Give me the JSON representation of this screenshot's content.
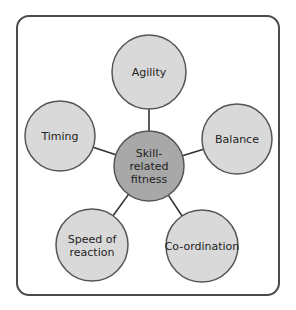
{
  "diagram": {
    "type": "spider",
    "colors": {
      "frame": "#4a4a4a",
      "outer_fill": "#d9d9d9",
      "center_fill": "#a8a8a8",
      "stroke": "#555555",
      "line": "#333333"
    },
    "center": {
      "lines": [
        "Skill-",
        "related",
        "fitness"
      ],
      "cx": 149,
      "cy": 166,
      "r": 35
    },
    "nodes": [
      {
        "id": "agility",
        "lines": [
          "Agility"
        ],
        "cx": 149,
        "cy": 72,
        "r": 37
      },
      {
        "id": "balance",
        "lines": [
          "Balance"
        ],
        "cx": 237,
        "cy": 139,
        "r": 35
      },
      {
        "id": "coordination",
        "lines": [
          "Co-ordination"
        ],
        "cx": 202,
        "cy": 246,
        "r": 36
      },
      {
        "id": "speed-of-reaction",
        "lines": [
          "Speed of",
          "reaction"
        ],
        "cx": 92,
        "cy": 245,
        "r": 36
      },
      {
        "id": "timing",
        "lines": [
          "Timing"
        ],
        "cx": 60,
        "cy": 136,
        "r": 35
      }
    ]
  }
}
